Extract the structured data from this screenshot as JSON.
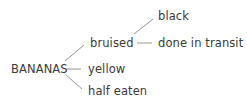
{
  "diagram": {
    "type": "tree",
    "root": {
      "label": "BANANAS",
      "children": [
        {
          "label": "bruised",
          "children": [
            {
              "label": "black"
            },
            {
              "label": "done in transit"
            }
          ]
        },
        {
          "label": "yellow"
        },
        {
          "label": "half eaten"
        }
      ]
    },
    "colors": {
      "text": "#3a3a3a",
      "connector": "#8a8a8a",
      "background": "#ffffff"
    }
  }
}
